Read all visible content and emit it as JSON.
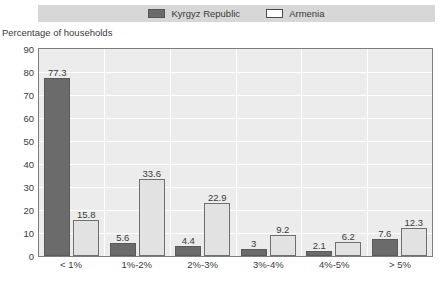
{
  "legend": {
    "entries": [
      {
        "label": "Kyrgyz Republic",
        "swatch": "filled-dark-square",
        "color": "#6b6b6b"
      },
      {
        "label": "Armenia",
        "swatch": "outlined-white-square",
        "color": "#ffffff"
      }
    ]
  },
  "axis": {
    "y_title": "Percentage of households",
    "y_ticks": [
      "90",
      "80",
      "70",
      "60",
      "50",
      "40",
      "30",
      "20",
      "10",
      "0"
    ]
  },
  "chart_data": {
    "type": "bar",
    "title": "",
    "subtitle": "",
    "xlabel": "",
    "ylabel": "Percentage of households",
    "ylim": [
      0,
      90
    ],
    "ytick_step": 10,
    "grid": true,
    "legend_position": "top-center",
    "categories": [
      "< 1%",
      "1%-2%",
      "2%-3%",
      "3%-4%",
      "4%-5%",
      "> 5%"
    ],
    "series": [
      {
        "name": "Kyrgyz Republic",
        "color": "#6b6b6b",
        "values": [
          77.3,
          5.6,
          4.4,
          3,
          2.1,
          7.6
        ],
        "labels": [
          "77.3",
          "5.6",
          "4.4",
          "3",
          "2.1",
          "7.6"
        ]
      },
      {
        "name": "Armenia",
        "color": "#e2e2e2",
        "values": [
          15.8,
          33.6,
          22.9,
          9.2,
          6.2,
          12.3
        ],
        "labels": [
          "15.8",
          "33.6",
          "22.9",
          "9.2",
          "6.2",
          "12.3"
        ]
      }
    ]
  }
}
